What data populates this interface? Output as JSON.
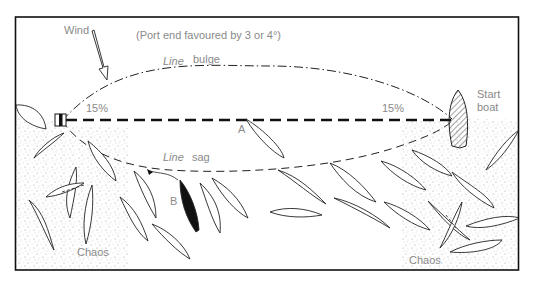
{
  "diagram": {
    "title_note": "(Port end favoured by 3 or 4°)",
    "labels": {
      "wind": "Wind",
      "line_bulge_word1": "Line",
      "line_bulge_word2": "bulge",
      "line_sag_word1": "Line",
      "line_sag_word2": "sag",
      "pct_left": "15%",
      "pct_right": "15%",
      "start_boat_line1": "Start",
      "start_boat_line2": "boat",
      "boat_a": "A",
      "boat_b": "B",
      "chaos_left": "Chaos",
      "chaos_right": "Chaos"
    },
    "elements": {
      "pin_mark": "pin-end buoy",
      "start_line": "dashed start line",
      "bulge_curve": "dash-dot curve above line",
      "sag_curve": "dashed curve below line",
      "wind_arrow": "hollow arrow pointing down-right"
    },
    "colors": {
      "ink": "#111111",
      "label": "#8a8a8a",
      "stipple": "#9a9a9a",
      "background": "#ffffff"
    }
  }
}
